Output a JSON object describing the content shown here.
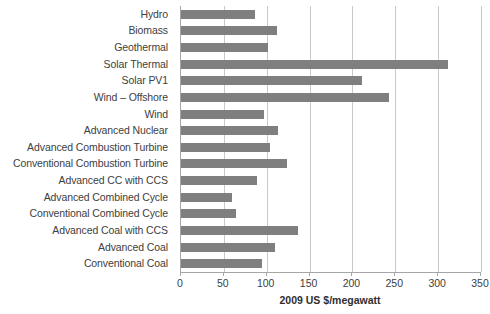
{
  "chart_data": {
    "type": "bar",
    "orientation": "horizontal",
    "title": "",
    "xlabel": "2009 US $/megawatt",
    "ylabel": "",
    "xlim": [
      0,
      350
    ],
    "xticks": [
      0,
      50,
      100,
      150,
      200,
      250,
      300,
      350
    ],
    "xtick_labels": [
      "0",
      "50",
      "100",
      "150",
      "200",
      "250",
      "300",
      "350"
    ],
    "grid": true,
    "grid_axis": "x",
    "legend": false,
    "bar_color": "#7f7f7f",
    "axis_color": "#a6a6a6",
    "gridline_color": "#c9c9c9",
    "categories": [
      "Hydro",
      "Biomass",
      "Geothermal",
      "Solar Thermal",
      "Solar PV1",
      "Wind – Offshore",
      "Wind",
      "Advanced Nuclear",
      "Advanced Combustion Turbine",
      "Conventional Combustion Turbine",
      "Advanced CC with CCS",
      "Advanced Combined Cycle",
      "Conventional Combined Cycle",
      "Advanced Coal with CCS",
      "Advanced Coal",
      "Conventional Coal"
    ],
    "values": [
      86,
      112,
      102,
      311,
      211,
      243,
      97,
      113,
      104,
      124,
      89,
      60,
      64,
      136,
      110,
      95
    ]
  }
}
